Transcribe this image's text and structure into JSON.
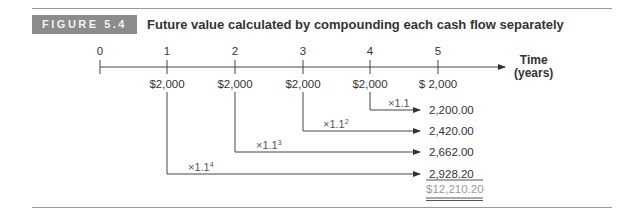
{
  "figure": {
    "label": "FIGURE 5.4",
    "title": "Future value calculated by compounding each cash flow separately"
  },
  "timeline": {
    "axis_label_line1": "Time",
    "axis_label_line2": "(years)",
    "ticks": [
      "0",
      "1",
      "2",
      "3",
      "4",
      "5"
    ],
    "cash_flows": [
      "$2,000",
      "$2,000",
      "$2,000",
      "$2,000",
      "$ 2,000"
    ]
  },
  "compounding": [
    {
      "from_year": "4",
      "multiplier": "×1.1",
      "exponent": "",
      "future_value": "2,200.00"
    },
    {
      "from_year": "3",
      "multiplier": "×1.1",
      "exponent": "2",
      "future_value": "2,420.00"
    },
    {
      "from_year": "2",
      "multiplier": "×1.1",
      "exponent": "3",
      "future_value": "2,662.00"
    },
    {
      "from_year": "1",
      "multiplier": "×1.1",
      "exponent": "4",
      "future_value": "2,928.20"
    }
  ],
  "total": "$12,210.20",
  "colors": {
    "label_bg": "#8c8c8c",
    "label_text": "#f2f2f2",
    "line": "#444444",
    "total_text": "#9a9a9a"
  }
}
